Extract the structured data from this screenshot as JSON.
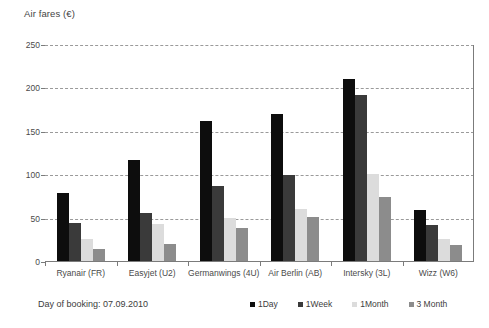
{
  "chart_data": {
    "type": "bar",
    "title": "",
    "ylabel": "Air fares (€)",
    "xlabel": "",
    "ylim": [
      0,
      250
    ],
    "yticks": [
      0,
      50,
      100,
      150,
      200,
      250
    ],
    "ytick_labels": [
      "0",
      "50",
      "100",
      "150",
      "200",
      "250"
    ],
    "grid": true,
    "legend_position": "bottom",
    "categories": [
      "Ryanair (FR)",
      "Easyjet (U2)",
      "Germanwings (4U)",
      "Air Berlin (AB)",
      "Intersky (3L)",
      "Wizz (W6)"
    ],
    "series": [
      {
        "name": "1Day",
        "color": "#0d0d0d",
        "values": [
          80,
          117,
          163,
          171,
          211,
          60
        ]
      },
      {
        "name": "1Week",
        "color": "#3a3a3a",
        "values": [
          45,
          57,
          87,
          100,
          192,
          43
        ]
      },
      {
        "name": "1Month",
        "color": "#dcdcdc",
        "values": [
          27,
          44,
          51,
          61,
          101,
          27
        ]
      },
      {
        "name": "3 Month",
        "color": "#8c8c8c",
        "values": [
          15,
          21,
          39,
          52,
          75,
          20
        ]
      }
    ],
    "annotations": [
      {
        "name": "booking-note",
        "text": "Day of booking: 07.09.2010"
      }
    ]
  },
  "footer": {
    "booking_note": "Day of booking: 07.09.2010"
  }
}
